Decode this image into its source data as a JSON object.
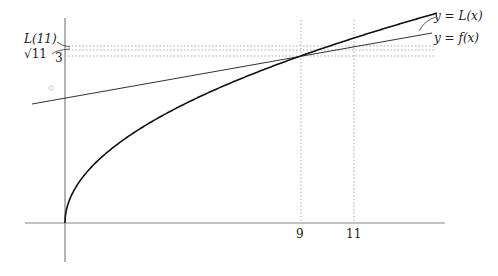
{
  "chart_data": {
    "type": "line",
    "curves": [
      {
        "name": "y = f(x)",
        "formula": "sqrt(x)"
      },
      {
        "name": "y = L(x)",
        "formula": "3 + (x-9)/6"
      }
    ],
    "x_ticks": [
      "9",
      "11"
    ],
    "y_ticks": [
      "3",
      "√11",
      "L(11)"
    ],
    "annotations": [
      "L(11)",
      "√11",
      "3",
      "y = L(x)",
      "y = f(x)"
    ],
    "xlim": [
      0,
      14.2
    ],
    "ylim": [
      -0.7,
      3.6
    ]
  },
  "labels": {
    "L11": "L(11)",
    "sqrt11": "√11",
    "three": "3",
    "nine": "9",
    "eleven": "11",
    "yL": "y = L(x)",
    "yf": "y = f(x)"
  }
}
